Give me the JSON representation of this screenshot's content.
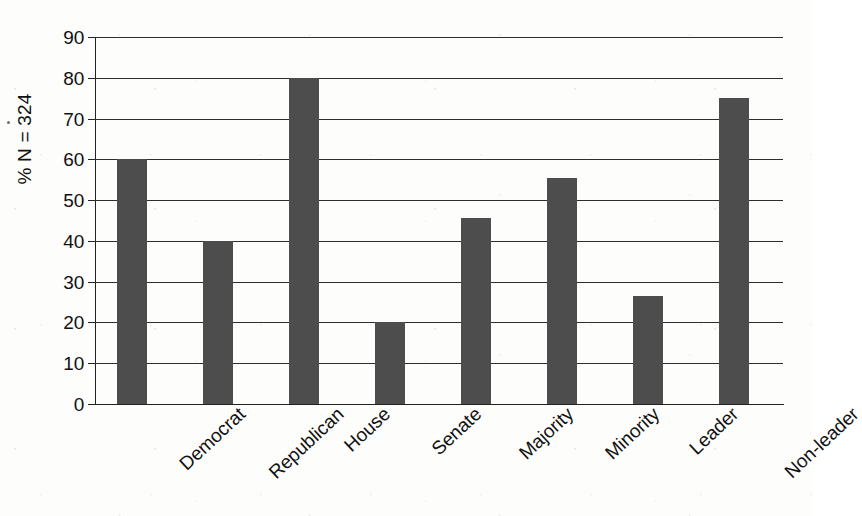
{
  "chart_data": {
    "type": "bar",
    "title": "",
    "subtitle": "",
    "xlabel": "",
    "ylabel": "% N = 324",
    "categories": [
      "Democrat",
      "Republican",
      "House",
      "Senate",
      "Majority",
      "Minority",
      "Leader",
      "Non-leader"
    ],
    "values": [
      60,
      40,
      80,
      20,
      45.5,
      55.5,
      26.5,
      75
    ],
    "ylim": [
      0,
      90
    ],
    "ytick_step": 10,
    "ytick_labels": [
      "90",
      "80",
      "70",
      "60",
      "50",
      "40",
      "30",
      "20",
      "10",
      "0"
    ],
    "ytick_values": [
      90,
      80,
      70,
      60,
      50,
      40,
      30,
      20,
      10,
      0
    ],
    "grid": true,
    "grid_axis": "y",
    "legend": false,
    "legend_position": "none",
    "series": [
      {
        "name": "",
        "values": [
          60,
          40,
          80,
          20,
          45.5,
          55.5,
          26.5,
          75
        ]
      }
    ],
    "bar_color": "#4d4d4d",
    "background_color": "#fdfdfc",
    "axis_color": "#222222",
    "xtick_label_rotation": -43
  }
}
